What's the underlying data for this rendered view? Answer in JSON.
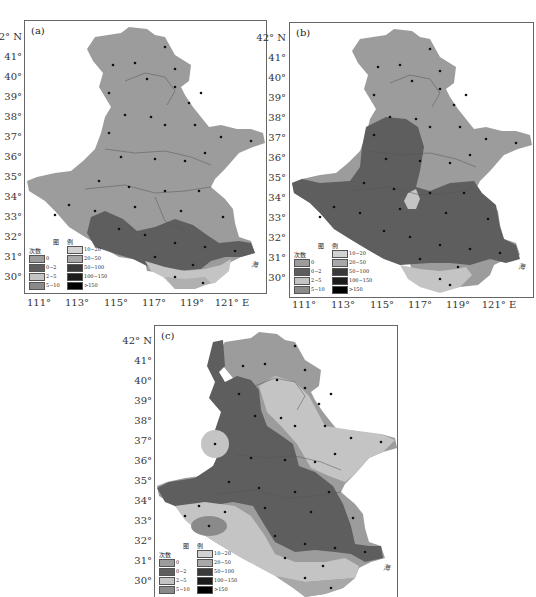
{
  "figure": {
    "panels": [
      {
        "id": "a",
        "label": "(a)"
      },
      {
        "id": "b",
        "label": "(b)"
      },
      {
        "id": "c",
        "label": "(c)"
      }
    ],
    "y_axis": [
      "42° N",
      "41°",
      "40°",
      "39°",
      "38°",
      "37°",
      "36°",
      "35°",
      "34°",
      "33°",
      "32°",
      "31°",
      "30°"
    ],
    "x_axis": [
      "111°",
      "113°",
      "115°",
      "117°",
      "119°",
      "121° E"
    ],
    "province_labels": [
      "河北省",
      "山东省",
      "河南省",
      "江苏省"
    ],
    "sea_label": "海",
    "legend": {
      "title": "图  例",
      "header": "次数",
      "items": [
        {
          "label": "0",
          "color": "#9c9c9c"
        },
        {
          "label": "0~2",
          "color": "#5e5e5e"
        },
        {
          "label": "2~5",
          "color": "#c4c4c4"
        },
        {
          "label": "5~10",
          "color": "#8a8a8a"
        },
        {
          "label": "10~20",
          "color": "#d2d2d2"
        },
        {
          "label": "20~50",
          "color": "#a8a8a8"
        },
        {
          "label": "50~100",
          "color": "#3a3a3a"
        },
        {
          "label": "100~150",
          "color": "#1c1c1c"
        },
        {
          "label": ">150",
          "color": "#000000"
        }
      ]
    }
  }
}
